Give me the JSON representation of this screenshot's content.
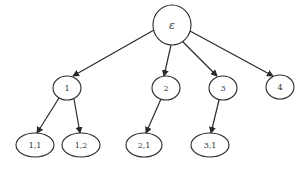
{
  "diagram": {
    "type": "tree",
    "root": {
      "id": "eps",
      "label": "ε"
    },
    "nodes": [
      {
        "id": "eps",
        "label": "ε",
        "cx": 172,
        "cy": 25,
        "rx": 19,
        "ry": 20
      },
      {
        "id": "n1",
        "label": "1",
        "cx": 67,
        "cy": 88,
        "rx": 14,
        "ry": 12
      },
      {
        "id": "n2",
        "label": "2",
        "cx": 166,
        "cy": 88,
        "rx": 14,
        "ry": 12
      },
      {
        "id": "n3",
        "label": "3",
        "cx": 223,
        "cy": 88,
        "rx": 14,
        "ry": 12
      },
      {
        "id": "n4",
        "label": "4",
        "cx": 280,
        "cy": 87,
        "rx": 14,
        "ry": 12
      },
      {
        "id": "n11",
        "label": "1,1",
        "cx": 35,
        "cy": 145,
        "rx": 19,
        "ry": 12
      },
      {
        "id": "n12",
        "label": "1,2",
        "cx": 81,
        "cy": 145,
        "rx": 19,
        "ry": 12
      },
      {
        "id": "n21",
        "label": "2,1",
        "cx": 144,
        "cy": 145,
        "rx": 18,
        "ry": 12
      },
      {
        "id": "n31",
        "label": "3,1",
        "cx": 210,
        "cy": 145,
        "rx": 19,
        "ry": 12
      }
    ],
    "edges": [
      {
        "from": "eps",
        "to": "n1",
        "x1": 154,
        "y1": 30,
        "x2": 73,
        "y2": 76
      },
      {
        "from": "eps",
        "to": "n2",
        "x1": 171,
        "y1": 45,
        "x2": 164,
        "y2": 76
      },
      {
        "from": "eps",
        "to": "n3",
        "x1": 182,
        "y1": 41,
        "x2": 217,
        "y2": 76
      },
      {
        "from": "eps",
        "to": "n4",
        "x1": 190,
        "y1": 31,
        "x2": 273,
        "y2": 76
      },
      {
        "from": "n1",
        "to": "n11",
        "x1": 59,
        "y1": 98,
        "x2": 37,
        "y2": 133
      },
      {
        "from": "n1",
        "to": "n12",
        "x1": 74,
        "y1": 99,
        "x2": 80,
        "y2": 133
      },
      {
        "from": "n2",
        "to": "n21",
        "x1": 161,
        "y1": 99,
        "x2": 146,
        "y2": 133
      },
      {
        "from": "n3",
        "to": "n31",
        "x1": 219,
        "y1": 100,
        "x2": 211,
        "y2": 133
      }
    ]
  }
}
